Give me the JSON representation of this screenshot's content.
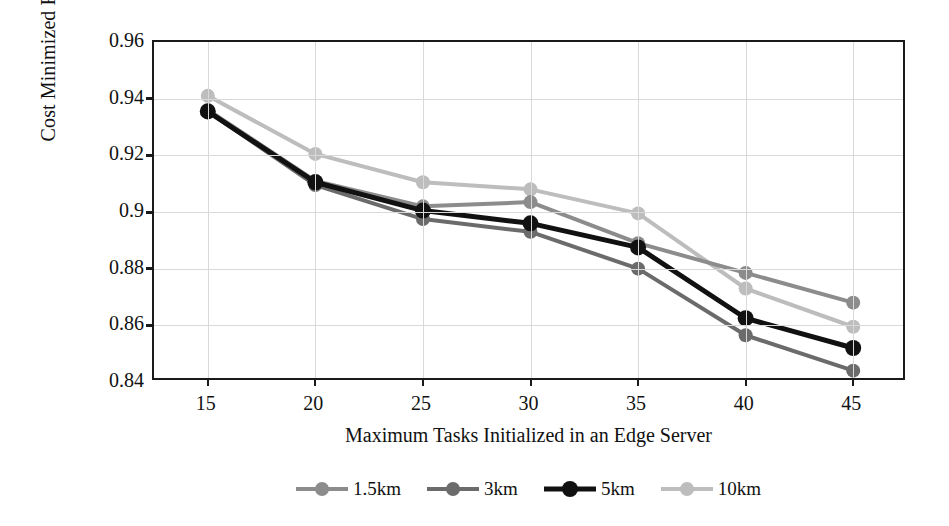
{
  "chart_data": {
    "type": "line",
    "title": "",
    "xlabel": "Maximum Tasks Initialized in an Edge Server",
    "ylabel": "Cost Minimized Ratio",
    "categories": [
      15,
      20,
      25,
      30,
      35,
      40,
      45
    ],
    "x_tick_labels": [
      "15",
      "20",
      "25",
      "30",
      "35",
      "40",
      "45"
    ],
    "y_tick_labels": [
      "0.96",
      "0.94",
      "0.92",
      "0.9",
      "0.88",
      "0.86",
      "0.84"
    ],
    "y_tick_values": [
      0.96,
      0.94,
      0.92,
      0.9,
      0.88,
      0.86,
      0.84
    ],
    "ylim": [
      0.84,
      0.96
    ],
    "xlim": [
      12.5,
      47.5
    ],
    "grid": true,
    "legend_position": "bottom",
    "marker": "circle",
    "series": [
      {
        "name": "1.5km",
        "color": "#8c8c8c",
        "line_width": 4,
        "marker_radius": 7,
        "values": [
          0.936,
          0.911,
          0.902,
          0.9035,
          0.889,
          0.8785,
          0.868
        ]
      },
      {
        "name": "3km",
        "color": "#6b6b6b",
        "line_width": 4,
        "marker_radius": 7,
        "values": [
          0.9355,
          0.9095,
          0.8975,
          0.893,
          0.88,
          0.8565,
          0.844
        ]
      },
      {
        "name": "5km",
        "color": "#111111",
        "line_width": 5,
        "marker_radius": 8,
        "values": [
          0.9355,
          0.9105,
          0.9005,
          0.896,
          0.8875,
          0.8625,
          0.852
        ]
      },
      {
        "name": "10km",
        "color": "#bdbdbd",
        "line_width": 4,
        "marker_radius": 7,
        "values": [
          0.941,
          0.9205,
          0.9105,
          0.908,
          0.8995,
          0.873,
          0.8595
        ]
      }
    ]
  },
  "colors": {
    "axis": "#1a1a1a",
    "grid": "#d9d9d9",
    "background": "#ffffff"
  }
}
